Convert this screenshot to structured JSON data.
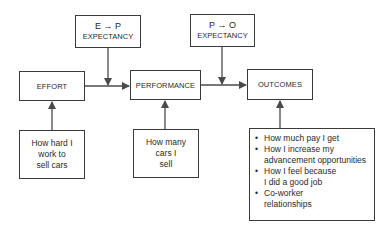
{
  "diagram": {
    "type": "expectancy-theory-flow",
    "expectancies": {
      "ep": {
        "top": "E → P",
        "bottom": "EXPECTANCY"
      },
      "po": {
        "top": "P → O",
        "bottom": "EXPECTANCY"
      }
    },
    "main_nodes": {
      "effort": "EFFORT",
      "performance": "PERFORMANCE",
      "outcomes": "OUTCOMES"
    },
    "examples": {
      "effort": [
        "How hard I",
        "work to",
        "sell cars"
      ],
      "performance": [
        "How many",
        "cars I",
        "sell"
      ],
      "outcomes": [
        [
          "How much pay I get"
        ],
        [
          "How I increase my",
          "advancement opportunities"
        ],
        [
          "How I feel because",
          "I did a good job"
        ],
        [
          "Co-worker",
          "relationships"
        ]
      ]
    },
    "bullet_glyph": "•",
    "colors": {
      "line": "#4a4a4a",
      "border": "#3a3a3a",
      "text": "#2a2a2a"
    }
  }
}
